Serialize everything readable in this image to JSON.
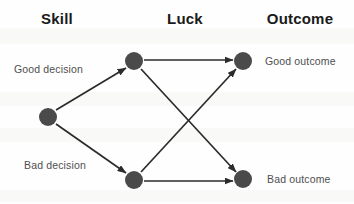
{
  "diagram": {
    "title_row": {
      "columns": [
        {
          "label": "Skill",
          "cx": 57,
          "y": 10
        },
        {
          "label": "Luck",
          "cx": 185,
          "y": 10
        },
        {
          "label": "Outcome",
          "cx": 300,
          "y": 10
        }
      ]
    },
    "nodes": [
      {
        "id": "skill",
        "name": "skill-node",
        "cx": 48,
        "cy": 117,
        "r": 9
      },
      {
        "id": "luck_top",
        "name": "luck-node-top",
        "cx": 134,
        "cy": 61,
        "r": 9
      },
      {
        "id": "luck_bottom",
        "name": "luck-node-bottom",
        "cx": 134,
        "cy": 180,
        "r": 9
      },
      {
        "id": "out_top",
        "name": "outcome-node-good",
        "cx": 243,
        "cy": 61,
        "r": 9
      },
      {
        "id": "out_bottom",
        "name": "outcome-node-bad",
        "cx": 243,
        "cy": 179,
        "r": 9
      }
    ],
    "edges": [
      {
        "id": "good_decision",
        "from": "skill",
        "to": "luck_top",
        "x1": 56,
        "y1": 110,
        "x2": 126,
        "y2": 68
      },
      {
        "id": "bad_decision",
        "from": "skill",
        "to": "luck_bottom",
        "x1": 56,
        "y1": 124,
        "x2": 126,
        "y2": 173
      },
      {
        "id": "luck_good_good",
        "from": "luck_top",
        "to": "out_top",
        "x1": 144,
        "y1": 60,
        "x2": 233,
        "y2": 60
      },
      {
        "id": "luck_good_bad",
        "from": "luck_top",
        "to": "out_bottom",
        "x1": 141,
        "y1": 69,
        "x2": 236,
        "y2": 172
      },
      {
        "id": "luck_bad_good",
        "from": "luck_bottom",
        "to": "out_top",
        "x1": 141,
        "y1": 172,
        "x2": 236,
        "y2": 69
      },
      {
        "id": "luck_bad_bad",
        "from": "luck_bottom",
        "to": "out_bottom",
        "x1": 144,
        "y1": 181,
        "x2": 233,
        "y2": 181
      }
    ],
    "edge_labels": [
      {
        "id": "good_decision_label",
        "text": "Good decision",
        "x": 14,
        "y": 63
      },
      {
        "id": "bad_decision_label",
        "text": "Bad decision",
        "x": 24,
        "y": 159
      }
    ],
    "outcome_labels": [
      {
        "id": "good_outcome_label",
        "text": "Good outcome",
        "x": 265,
        "y": 55
      },
      {
        "id": "bad_outcome_label",
        "text": "Bad outcome",
        "x": 267,
        "y": 173
      }
    ],
    "colors": {
      "node_fill": "#4a4a4a",
      "edge_stroke": "#2b2b2b",
      "header_text": "#1a1a1a",
      "label_text": "#4f4f4f",
      "background": "#fefefe"
    },
    "artifacts": [
      {
        "id": "ghost-band-1",
        "top": 28,
        "height": 16
      },
      {
        "id": "ghost-band-2",
        "top": 92,
        "height": 14
      },
      {
        "id": "ghost-band-3",
        "top": 128,
        "height": 14
      },
      {
        "id": "ghost-band-4",
        "top": 190,
        "height": 12
      }
    ]
  }
}
